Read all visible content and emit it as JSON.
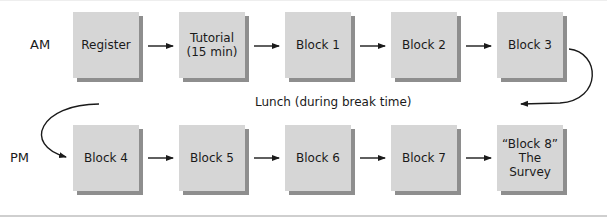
{
  "diagram": {
    "rows": [
      {
        "label": "AM",
        "blocks": [
          "Register",
          "Tutorial\n(15 min)",
          "Block 1",
          "Block 2",
          "Block 3"
        ]
      },
      {
        "label": "PM",
        "blocks": [
          "Block 4",
          "Block 5",
          "Block 6",
          "Block 7",
          "“Block 8”\nThe Survey"
        ]
      }
    ],
    "transition_label": "Lunch (during break time)",
    "colors": {
      "box_fill": "#d6d6d6",
      "box_shadow": "#8e8e8e",
      "arrow": "#1a1a1a"
    }
  }
}
